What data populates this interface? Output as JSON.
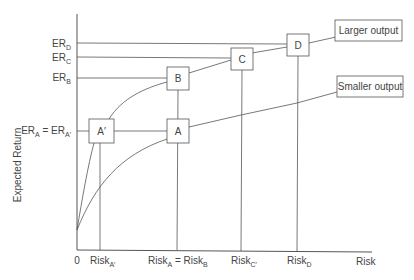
{
  "diagram": {
    "y_axis_label": "Expected Return",
    "x_axis_label": "Risk",
    "origin_label": "0",
    "y_ticks": [
      {
        "main": "ER",
        "sub": "D"
      },
      {
        "main": "ER",
        "sub": "C"
      },
      {
        "main": "ER",
        "sub": "B"
      },
      {
        "main": "ER",
        "sub": "A",
        "eq": " = ER",
        "sub2": "A′"
      }
    ],
    "x_ticks": [
      {
        "main": "Risk",
        "sub": "A′"
      },
      {
        "main": "Risk",
        "sub": "A",
        "eq": " = Risk",
        "sub2": "B"
      },
      {
        "main": "Risk",
        "sub": "C′"
      },
      {
        "main": "Risk",
        "sub": "D"
      }
    ],
    "points": {
      "a_prime": "A′",
      "a": "A",
      "b": "B",
      "c": "C",
      "d": "D"
    },
    "curves": {
      "larger": "Larger output",
      "smaller": "Smaller output"
    },
    "colors": {
      "line": "#555555",
      "text": "#444444"
    }
  }
}
